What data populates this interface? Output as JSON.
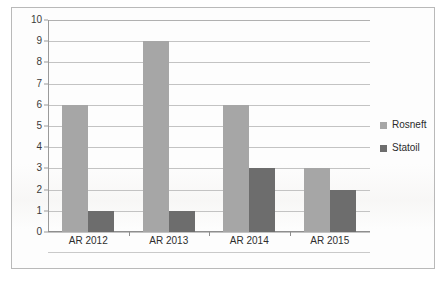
{
  "chart_data": {
    "type": "bar",
    "title": "",
    "subtitle": "",
    "xlabel": "",
    "ylabel": "",
    "categories": [
      "AR 2012",
      "AR 2013",
      "AR 2014",
      "AR 2015"
    ],
    "series": [
      {
        "name": "Rosneft",
        "values": [
          6,
          9,
          6,
          3
        ],
        "color": "#a6a6a6"
      },
      {
        "name": "Statoil",
        "values": [
          1,
          1,
          3,
          2
        ],
        "color": "#6d6d6d"
      }
    ],
    "ylim": [
      0,
      10
    ],
    "ytick_labels": [
      "10",
      "9",
      "8",
      "7",
      "6",
      "5",
      "4",
      "3",
      "2",
      "1",
      "0"
    ],
    "ytick_values": [
      10,
      9,
      8,
      7,
      6,
      5,
      4,
      3,
      2,
      1,
      0
    ],
    "grid": true,
    "grid_axis": "y",
    "legend": true,
    "legend_position": "right",
    "legend_entries": [
      "Rosneft",
      "Statoil"
    ]
  },
  "colors": {
    "series_rosneft": "#a6a6a6",
    "series_statoil": "#6d6d6d",
    "gridline": "#c3c3c3",
    "axis": "#8e8e8e",
    "frame": "#b9b9b9",
    "background": "#fdfdfd",
    "text": "#2e2e2e"
  }
}
